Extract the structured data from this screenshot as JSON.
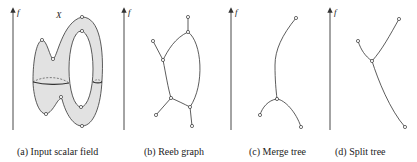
{
  "panels": [
    {
      "id": "a",
      "caption": "(a) Input scalar field",
      "axis_label": "f",
      "surface_label": "X"
    },
    {
      "id": "b",
      "caption": "(b) Reeb graph",
      "axis_label": "f"
    },
    {
      "id": "c",
      "caption": "(c) Merge tree",
      "axis_label": "f"
    },
    {
      "id": "d",
      "caption": "(d) Split tree",
      "axis_label": "f"
    }
  ],
  "colors": {
    "stroke": "#333333",
    "fill": "#e2e2e2",
    "node_fill": "#ffffff"
  }
}
